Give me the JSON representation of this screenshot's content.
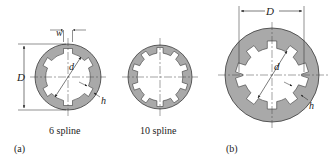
{
  "figure_a": {
    "panel_label": "(a)",
    "six_spline": {
      "caption": "6 spline",
      "splines": 6,
      "dim_width": "w",
      "dim_outer": "D",
      "dim_inner": "d",
      "dim_height": "h"
    },
    "ten_spline": {
      "caption": "10 spline",
      "splines": 10
    }
  },
  "figure_b": {
    "panel_label": "(b)",
    "splines": 10,
    "dim_outer": "D",
    "dim_inner": "d",
    "dim_height": "h"
  },
  "colors": {
    "fill": "#a9a9a9",
    "stroke": "#3a3a3a",
    "background": "#ffffff"
  }
}
